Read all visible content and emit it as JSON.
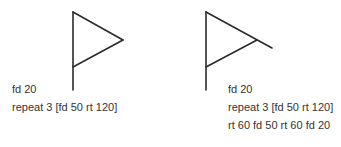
{
  "stroke_color": "#2b2b2b",
  "text_color": "#333333",
  "panels": [
    {
      "name": "flag",
      "code_lines": [
        "fd 20",
        "repeat 3 [fd 50 rt 120]"
      ]
    },
    {
      "name": "flag-extended",
      "code_lines": [
        "fd 20",
        "repeat 3 [fd 50 rt 120]",
        "rt 60 fd 50 rt 60 fd 20"
      ]
    }
  ]
}
